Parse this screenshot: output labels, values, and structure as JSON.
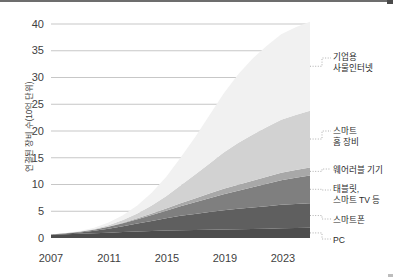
{
  "chart_data": {
    "type": "area",
    "title": "",
    "subtitle": "",
    "xlabel": "",
    "ylabel": "연결된 장비 수(10억 단위)",
    "stacked": true,
    "grid": true,
    "legend_position": "right-outside",
    "xlim": [
      2007,
      2025
    ],
    "ylim": [
      0,
      40
    ],
    "yticks": [
      0,
      5,
      10,
      15,
      20,
      25,
      30,
      35,
      40
    ],
    "ytick_labels": [
      "0",
      "5",
      "10",
      "15",
      "20",
      "25",
      "30",
      "35",
      "40"
    ],
    "xticks": [
      2007,
      2011,
      2015,
      2019,
      2023
    ],
    "xtick_labels": [
      "2007",
      "2011",
      "2015",
      "2019",
      "2023"
    ],
    "x": [
      2007,
      2008,
      2009,
      2010,
      2011,
      2012,
      2013,
      2014,
      2015,
      2016,
      2017,
      2018,
      2019,
      2020,
      2021,
      2022,
      2023,
      2024,
      2025
    ],
    "series": [
      {
        "name": "PC",
        "label": "PC",
        "color": "#4d4d4d",
        "values": [
          0.6,
          0.7,
          0.8,
          0.9,
          1.0,
          1.1,
          1.2,
          1.3,
          1.4,
          1.45,
          1.5,
          1.55,
          1.6,
          1.65,
          1.7,
          1.75,
          1.8,
          1.85,
          1.9
        ]
      },
      {
        "name": "스마트폰",
        "label": "스마트폰",
        "color": "#5f5f5f",
        "values": [
          0.05,
          0.12,
          0.25,
          0.45,
          0.75,
          1.1,
          1.5,
          1.9,
          2.3,
          2.7,
          3.0,
          3.3,
          3.6,
          3.8,
          4.0,
          4.2,
          4.4,
          4.5,
          4.6
        ]
      },
      {
        "name": "태블릿, 스마트 TV 등",
        "label": "태블릿,\n스마트 TV 등",
        "color": "#7f7f7f",
        "values": [
          0.02,
          0.05,
          0.1,
          0.2,
          0.35,
          0.55,
          0.8,
          1.1,
          1.4,
          1.8,
          2.2,
          2.6,
          3.0,
          3.4,
          3.8,
          4.2,
          4.6,
          4.9,
          5.2
        ]
      },
      {
        "name": "웨어러블 기기",
        "label": "웨어러블 기기",
        "color": "#a8a8a8",
        "values": [
          0.0,
          0.0,
          0.0,
          0.02,
          0.05,
          0.1,
          0.18,
          0.28,
          0.4,
          0.55,
          0.7,
          0.85,
          1.0,
          1.1,
          1.2,
          1.3,
          1.4,
          1.45,
          1.5
        ]
      },
      {
        "name": "스마트 홈 장비",
        "label": "스마트\n홈 장비",
        "color": "#d2d2d2",
        "values": [
          0.0,
          0.02,
          0.05,
          0.1,
          0.25,
          0.5,
          0.9,
          1.5,
          2.3,
          3.3,
          4.4,
          5.6,
          6.8,
          7.8,
          8.6,
          9.3,
          9.9,
          10.3,
          10.6
        ]
      },
      {
        "name": "기업용 사물인터넷",
        "label": "기업용\n사물인터넷",
        "color": "#f1f1f1",
        "values": [
          0.0,
          0.05,
          0.1,
          0.25,
          0.5,
          0.9,
          1.5,
          2.4,
          3.6,
          5.2,
          7.0,
          9.0,
          11.0,
          12.8,
          14.2,
          15.2,
          16.0,
          16.4,
          16.6
        ]
      }
    ],
    "legend_entries": [
      {
        "label_line1": "기업용",
        "label_line2": "사물인터넷",
        "series": "기업용 사물인터넷"
      },
      {
        "label_line1": "스마트",
        "label_line2": "홈 장비",
        "series": "스마트 홈 장비"
      },
      {
        "label_line1": "웨어러블 기기",
        "label_line2": "",
        "series": "웨어러블 기기"
      },
      {
        "label_line1": "태블릿,",
        "label_line2": "스마트 TV 등",
        "series": "태블릿, 스마트 TV 등"
      },
      {
        "label_line1": "스마트폰",
        "label_line2": "",
        "series": "스마트폰"
      },
      {
        "label_line1": "PC",
        "label_line2": "",
        "series": "PC"
      }
    ],
    "colors": {
      "gridline": "#b9b9b9",
      "axis_text": "#3f3f3f",
      "background": "#ffffff",
      "leader_line": "#9a9a9a"
    }
  }
}
